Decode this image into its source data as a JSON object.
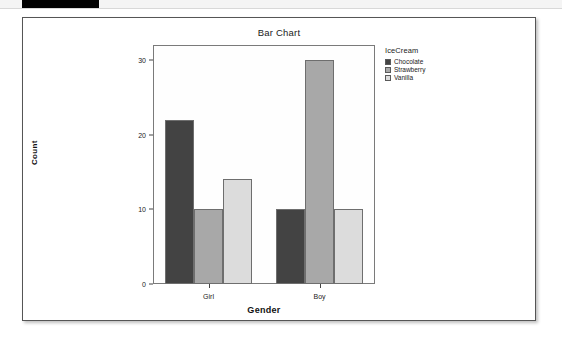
{
  "window": {
    "header_strip_color": "#f4f4f4",
    "header_block_color": "#000000"
  },
  "panel": {
    "border_color": "#555555",
    "background": "#ffffff"
  },
  "chart_data": {
    "type": "bar",
    "title": "Bar Chart",
    "xlabel": "Gender",
    "ylabel": "Count",
    "categories": [
      "Girl",
      "Boy"
    ],
    "ylim": [
      0,
      32
    ],
    "yticks": [
      0,
      10,
      20,
      30
    ],
    "ytick_labels": [
      "0",
      "10",
      "20",
      "30"
    ],
    "grid": false,
    "legend_position": "right",
    "legend_title": "IceCream",
    "series": [
      {
        "name": "Chocolate",
        "values": [
          22,
          10
        ],
        "color": "#434343"
      },
      {
        "name": "Strawberry",
        "values": [
          10,
          30
        ],
        "color": "#a8a8a8"
      },
      {
        "name": "Vanilla",
        "values": [
          14,
          10
        ],
        "color": "#dcdcdc"
      }
    ]
  }
}
